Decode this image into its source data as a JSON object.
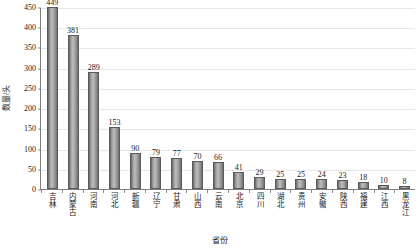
{
  "chart_data": {
    "type": "bar",
    "title": "",
    "xlabel": "省份",
    "ylabel": "数量/头",
    "ylim": [
      0,
      450
    ],
    "ytick_step": 50,
    "grid": true,
    "legend": "none",
    "bar_color": "#9e9e9e",
    "categories": [
      "吉林",
      "内蒙古",
      "河南",
      "河北",
      "新疆",
      "辽宁",
      "甘肃",
      "山西",
      "云南",
      "北京",
      "四川",
      "湖北",
      "贵州",
      "安徽",
      "陕西",
      "福建",
      "江西",
      "黑龙江"
    ],
    "values": [
      449,
      381,
      289,
      153,
      90,
      79,
      77,
      70,
      66,
      41,
      29,
      25,
      25,
      24,
      23,
      18,
      10,
      8
    ],
    "yticks": [
      0,
      50,
      100,
      150,
      200,
      250,
      300,
      350,
      400,
      450
    ],
    "ytick_labels": [
      "0",
      "50",
      "100",
      "150",
      "200",
      "250",
      "300",
      "350",
      "400",
      "450"
    ]
  }
}
